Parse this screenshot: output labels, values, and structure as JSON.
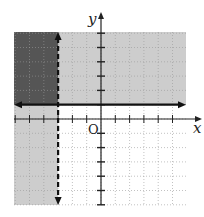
{
  "chart_data": {
    "type": "inequality-graph",
    "title": "",
    "xlabel": "x",
    "ylabel": "y",
    "origin_label": "O",
    "xlim": [
      -6,
      6
    ],
    "ylim": [
      -6,
      6
    ],
    "grid": true,
    "boundaries": [
      {
        "name": "x = -3",
        "orientation": "vertical",
        "value": -3,
        "style": "dashed",
        "shade": "left",
        "inequality": "x < -3"
      },
      {
        "name": "y = 1",
        "orientation": "horizontal",
        "value": 1,
        "style": "solid",
        "shade": "above",
        "inequality": "y >= 1"
      }
    ],
    "regions": [
      {
        "name": "solution-overlap",
        "description": "x < -3 and y >= 1",
        "color": "#555555"
      },
      {
        "name": "single-shaded",
        "description": "x < -3 or y >= 1 (not both)",
        "color": "#c8c8c8"
      }
    ]
  },
  "labels": {
    "x": "x",
    "y": "y",
    "origin": "O"
  },
  "colors": {
    "dark": "#555555",
    "light": "#cdcdcd",
    "axis": "#222222",
    "grid": "#999999"
  }
}
